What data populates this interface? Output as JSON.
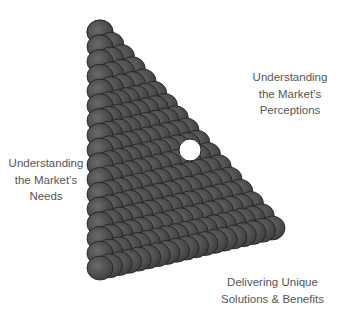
{
  "diagram": {
    "type": "triangle",
    "fill_color": "#4a4a4a",
    "edge_color": "#1e1e1e",
    "center_hole_color": "#ffffff"
  },
  "labels": {
    "right": {
      "lines": [
        "Understanding",
        "the Market’s",
        "Perceptions"
      ]
    },
    "left": {
      "lines": [
        "Understanding",
        "the Market’s",
        "Needs"
      ]
    },
    "bottom": {
      "lines": [
        "Delivering Unique",
        "Solutions & Benefits"
      ]
    }
  },
  "text_color": "#555555"
}
